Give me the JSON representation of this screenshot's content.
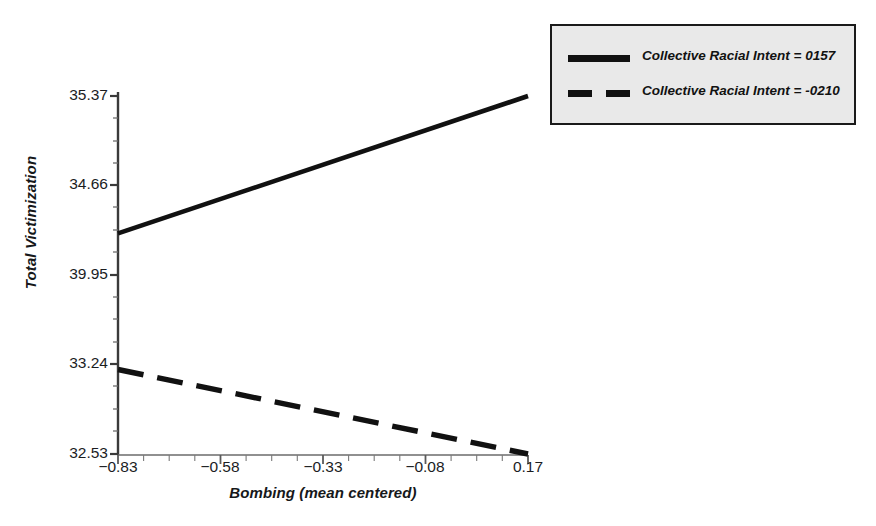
{
  "chart_data": {
    "type": "line",
    "title": "",
    "xlabel": "Bombing (mean centered)",
    "ylabel": "Total Victimization",
    "x": [
      -0.83,
      0.17
    ],
    "xlim": [
      -0.83,
      0.17
    ],
    "ylim": [
      32.53,
      35.37
    ],
    "xticks": [
      -0.83,
      -0.58,
      -0.33,
      -0.08,
      0.17
    ],
    "xtick_labels": [
      "−0.83",
      "−0.58",
      "−0.33",
      "−0.08",
      "0.17"
    ],
    "yticks": [
      32.53,
      33.24,
      33.95,
      34.66,
      35.37
    ],
    "ytick_labels": [
      "32.53",
      "33.24",
      "39.95",
      "34.66",
      "35.37"
    ],
    "grid": false,
    "legend_position": "top-right",
    "series": [
      {
        "name": "Collective Racial Intent = 0157",
        "style": "solid",
        "color": "#111111",
        "x": [
          -0.83,
          0.17
        ],
        "values": [
          34.28,
          35.37
        ]
      },
      {
        "name": "Collective Racial Intent = -0210",
        "style": "dashed",
        "color": "#111111",
        "x": [
          -0.83,
          0.17
        ],
        "values": [
          33.2,
          32.53
        ]
      }
    ]
  },
  "axes": {
    "y_title": "Total Victimization",
    "x_title": "Bombing (mean centered)",
    "y_labels": {
      "t4": "35.37",
      "t3": "34.66",
      "t2": "39.95",
      "t1": "33.24",
      "t0": "32.53"
    },
    "x_labels": {
      "t0": "−0.83",
      "t1": "−0.58",
      "t2": "−0.33",
      "t3": "−0.08",
      "t4": "0.17"
    }
  },
  "legend": {
    "entries": [
      {
        "label": "Collective Racial Intent = 0157",
        "style": "solid"
      },
      {
        "label": "Collective Racial Intent = -0210",
        "style": "dashed"
      }
    ]
  },
  "colors": {
    "line": "#111111",
    "axis": "#3a3a3a",
    "legend_fill": "#e9e9e9",
    "legend_border": "#1a1a1a",
    "background": "#ffffff",
    "text": "#16181a"
  }
}
